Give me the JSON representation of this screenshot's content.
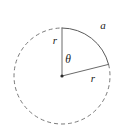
{
  "figure": {
    "kind": "circle-sector-diagram",
    "width": 121,
    "height": 135,
    "background_color": "#ffffff"
  },
  "geometry": {
    "center": {
      "x": 62,
      "y": 76
    },
    "radius": 48,
    "center_dot_radius": 1.6,
    "solid_arc": {
      "start_angle_deg": 90,
      "end_angle_deg": 14,
      "description": "solid arc subtending the central angle, labeled a"
    },
    "dashed_arc": {
      "start_angle_deg": 14,
      "end_angle_deg": -270,
      "description": "remainder of the circle drawn dashed"
    },
    "radii": [
      {
        "id": "vertical-radius",
        "angle_deg": 90,
        "label": "r"
      },
      {
        "id": "slanted-radius",
        "angle_deg": 14,
        "label": "r"
      }
    ]
  },
  "style": {
    "stroke_color": "#6e6e6e",
    "solid_stroke_color": "#5a5a5a",
    "dashed_stroke_color": "#7a7a7a",
    "radius_stroke_color": "#6a6a6a",
    "dot_color": "#2b2b2b",
    "label_color": "#1a1a1a",
    "stroke_width": 1,
    "dash_pattern": "4 3"
  },
  "labels": {
    "arc_length": {
      "text": "a",
      "x": 103,
      "y": 26
    },
    "radius_vertical": {
      "text": "r",
      "x": 55,
      "y": 41
    },
    "radius_slanted": {
      "text": "r",
      "x": 93,
      "y": 79
    },
    "angle": {
      "text": "θ",
      "x": 68,
      "y": 60
    }
  }
}
